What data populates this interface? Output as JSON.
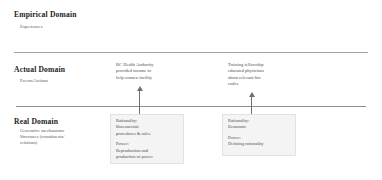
{
  "diagram": {
    "tiers": [
      {
        "id": "empirical",
        "label": "Empirical Domain",
        "sublabel": "Experiences"
      },
      {
        "id": "actual",
        "label": "Actual Domain",
        "sublabel": "Events/Actions"
      },
      {
        "id": "real",
        "label": "Real Domain",
        "sublabel_lines": [
          "Generative mechanisms",
          "Structures (constituents/",
          "relations)"
        ]
      }
    ],
    "notes": {
      "actual_middle": [
        "BC Health Authority",
        "provided income to",
        "help women facility"
      ],
      "actual_right": [
        "Training fellowship",
        "educated physicians",
        "about relevant bio",
        "codes"
      ],
      "real_middle": {
        "group_one": [
          "Rationality:",
          "Bureaucratic",
          "procedures & rules"
        ],
        "group_two": [
          "Power:",
          "Reproduction and",
          "production of power",
          "relations"
        ]
      },
      "real_right": {
        "group_one": [
          "Rationality:",
          "Economic"
        ],
        "group_two": [
          "Power:",
          "Defining rationality"
        ]
      }
    },
    "arrows": [
      {
        "id": "arrow-real-to-actual-middle",
        "direction": "up"
      },
      {
        "id": "arrow-real-to-actual-right",
        "direction": "up"
      }
    ],
    "colors": {
      "background": "#ffffff",
      "text": "#2b2b2b",
      "muted_text": "#4e4e4e",
      "divider": "#9a9a9a",
      "box_fill": "#f4f4f4",
      "arrow": "#6f6f6f"
    }
  }
}
